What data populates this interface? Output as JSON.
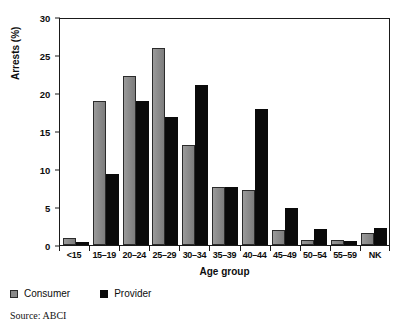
{
  "chart_data": {
    "type": "bar",
    "title": "",
    "xlabel": "Age group",
    "ylabel": "Arrests (%)",
    "ylim": [
      0,
      30
    ],
    "yticks": [
      0,
      5,
      10,
      15,
      20,
      25,
      30
    ],
    "ytick_labels": [
      "0",
      "5",
      "10",
      "15",
      "20",
      "25",
      "30"
    ],
    "grid": false,
    "legend_position": "below-left",
    "categories": [
      "<15",
      "15–19",
      "20–24",
      "25–29",
      "30–34",
      "35–39",
      "40–44",
      "45–49",
      "50–54",
      "55–59",
      "NK"
    ],
    "series": [
      {
        "name": "Consumer",
        "color": "#8a8a8a",
        "values": [
          0.9,
          18.9,
          22.3,
          25.9,
          13.2,
          7.6,
          7.2,
          2.0,
          0.6,
          0.6,
          1.6
        ]
      },
      {
        "name": "Provider",
        "color": "#0a0a0a",
        "values": [
          0.35,
          9.4,
          18.9,
          16.9,
          21.1,
          7.6,
          17.9,
          4.9,
          2.1,
          0.5,
          2.2
        ]
      }
    ],
    "annotations": {
      "source": "Source: ABCI"
    }
  },
  "legend": {
    "items": [
      {
        "label": "Consumer",
        "swatch": "gray-square-swatch"
      },
      {
        "label": "Provider",
        "swatch": "black-square-swatch"
      }
    ]
  },
  "footer": {
    "source": "Source: ABCI"
  }
}
